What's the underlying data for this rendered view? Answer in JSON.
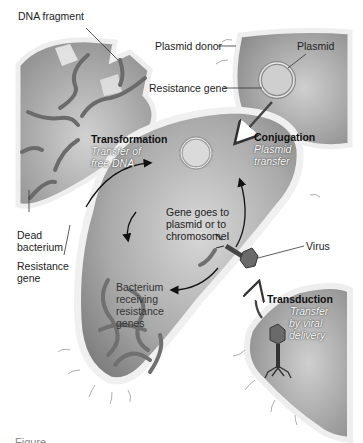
{
  "diagram": {
    "labels": {
      "dna_fragment": "DNA fragment",
      "plasmid_donor": "Plasmid donor",
      "plasmid": "Plasmid",
      "resistance_gene_top": "Resistance gene",
      "transformation_title": "Transformation",
      "transformation_desc_1": "Transfer of",
      "transformation_desc_2": "free DNA",
      "conjugation_title": "Conjugation",
      "conjugation_desc_1": "Plasmid",
      "conjugation_desc_2": "transfer",
      "gene_goes_1": "Gene goes to",
      "gene_goes_2": "plasmid or to",
      "gene_goes_3": "chromosome",
      "dead_bacterium_1": "Dead",
      "dead_bacterium_2": "bacterium",
      "resistance_gene_left_1": "Resistance",
      "resistance_gene_left_2": "gene",
      "virus": "Virus",
      "receiving_1": "Bacterium",
      "receiving_2": "receiving",
      "receiving_3": "resistance",
      "receiving_4": "genes",
      "transduction_title": "Transduction",
      "transduction_desc_1": "Transfer",
      "transduction_desc_2": "by viral",
      "transduction_desc_3": "delivery"
    },
    "caption": "Figure"
  },
  "colors": {
    "cell_fill": "#9c9c9c",
    "cell_wall": "#e6e6e6",
    "dna": "#6e6e6e",
    "arrow": "#111111",
    "background": "#ffffff"
  }
}
